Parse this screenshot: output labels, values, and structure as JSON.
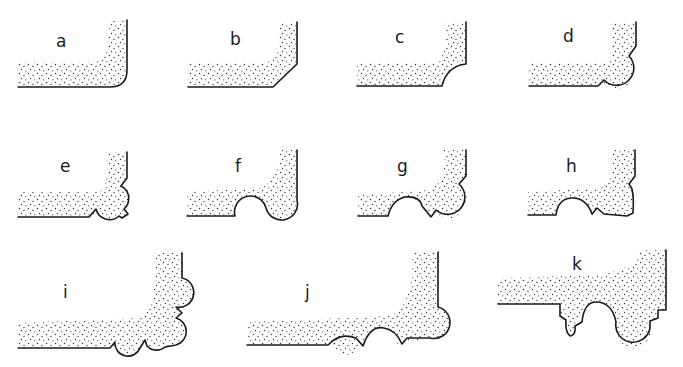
{
  "diagram": {
    "title": "",
    "colors": {
      "ink": "#1a1a1a",
      "background": "#ffffff"
    },
    "profiles": [
      {
        "id": "a",
        "label": "a",
        "shape": "rounded corner (bullnose radius)"
      },
      {
        "id": "b",
        "label": "b",
        "shape": "chamfered corner"
      },
      {
        "id": "c",
        "label": "c",
        "shape": "concave cove corner"
      },
      {
        "id": "d",
        "label": "d",
        "shape": "bead (round) corner"
      },
      {
        "id": "e",
        "label": "e",
        "shape": "bead with small quirks/fillets"
      },
      {
        "id": "f",
        "label": "f",
        "shape": "cove plus bullnose"
      },
      {
        "id": "g",
        "label": "g",
        "shape": "cove, quirk and bead"
      },
      {
        "id": "h",
        "label": "h",
        "shape": "cove, quirk and bead with fillets"
      },
      {
        "id": "i",
        "label": "i",
        "shape": "multiple beads with quirks along both faces"
      },
      {
        "id": "j",
        "label": "j",
        "shape": "beads and cove along bottom face with corner bead"
      },
      {
        "id": "k",
        "label": "k",
        "shape": "stepped profile with drop bead, cove and large bead"
      }
    ]
  }
}
